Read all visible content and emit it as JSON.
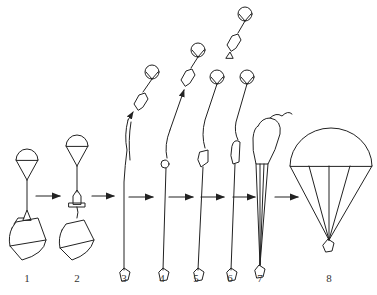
{
  "diagram": {
    "type": "parachute-deployment-sequence",
    "stages": [
      {
        "label": "1",
        "x": 27
      },
      {
        "label": "2",
        "x": 77
      },
      {
        "label": "3",
        "x": 124
      },
      {
        "label": "4",
        "x": 162
      },
      {
        "label": "5",
        "x": 196
      },
      {
        "label": "6",
        "x": 230
      },
      {
        "label": "7",
        "x": 260
      },
      {
        "label": "8",
        "x": 330
      }
    ],
    "arrows": [
      {
        "x1": 37,
        "x2": 60,
        "y": 197
      },
      {
        "x1": 93,
        "x2": 113,
        "y": 197
      },
      {
        "x1": 130,
        "x2": 152,
        "y": 197
      },
      {
        "x1": 170,
        "x2": 192,
        "y": 197
      },
      {
        "x1": 202,
        "x2": 224,
        "y": 197
      },
      {
        "x1": 234,
        "x2": 256,
        "y": 197
      },
      {
        "x1": 275,
        "x2": 298,
        "y": 197
      }
    ],
    "stroke_color": "#222222"
  }
}
